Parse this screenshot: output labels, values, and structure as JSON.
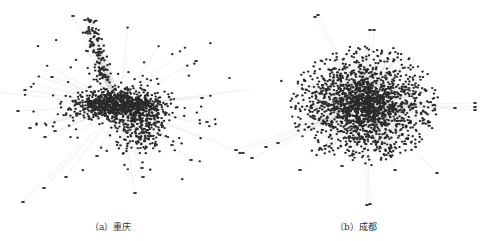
{
  "figure": {
    "panels": [
      {
        "id": "a",
        "caption": "（a）重庆",
        "city": "重庆",
        "description": "Network graph: dense central cluster elongated horizontally, with an upward branch and scattered peripheral nodes",
        "node_color": "#2a2a2a",
        "edge_color": "#cfcfcf"
      },
      {
        "id": "b",
        "caption": "（b）成都",
        "city": "成都",
        "description": "Network graph: large dense roughly circular core with many radiating peripheral nodes and spokes",
        "node_color": "#2a2a2a",
        "edge_color": "#cfcfcf"
      }
    ]
  }
}
